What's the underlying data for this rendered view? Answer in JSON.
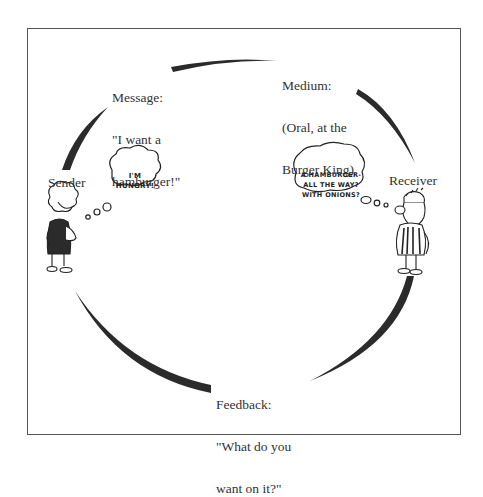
{
  "diagram": {
    "type": "communication-cycle",
    "nodes": {
      "sender": {
        "label": "Sender",
        "thought": [
          "I'M",
          "HUNGRY!"
        ]
      },
      "message": {
        "label": [
          "Message:",
          "\"I want a",
          "hamburger!\""
        ]
      },
      "medium": {
        "label": [
          "Medium:",
          "(Oral, at the",
          "Burger King)"
        ]
      },
      "receiver": {
        "label": "Receiver",
        "thought": [
          "A HAMBURGER-",
          "ALL THE WAY?",
          "WITH ONIONS?"
        ]
      },
      "feedback": {
        "label": [
          "Feedback:",
          "\"What do you",
          "want on it?\""
        ]
      }
    },
    "colors": {
      "arc": "#2b2b2b",
      "frame": "#555555",
      "text": "#333333"
    }
  }
}
